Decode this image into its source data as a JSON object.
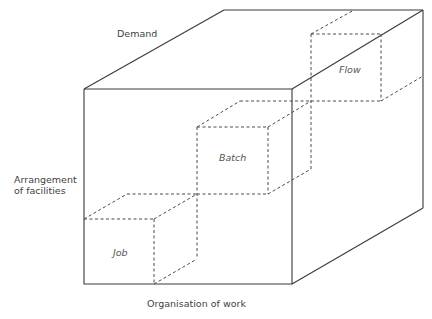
{
  "diagram": {
    "title": "",
    "axes": {
      "demand": "Demand",
      "arrangement_line1": "Arrangement",
      "arrangement_line2": "of facilities",
      "organisation": "Organisation of work"
    },
    "cells": {
      "job": "Job",
      "batch": "Batch",
      "flow": "Flow"
    },
    "colors": {
      "line": "#3a3a3a",
      "dashed": "#4a4a4a",
      "text": "#3f3f3f",
      "background": "#ffffff"
    }
  }
}
